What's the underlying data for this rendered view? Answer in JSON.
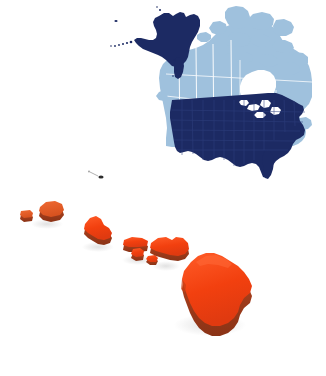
{
  "image": {
    "title": "North America and Hawaii Map",
    "background_color": "#ffffff",
    "width": 326,
    "height": 376,
    "description": "Map illustration of North America with the Hawaiian Islands shown in 3D relief below"
  },
  "palette": {
    "usa_fill": "#1c2a63",
    "usa_border": "#2a3a78",
    "alaska_fill": "#1c2a63",
    "canada_fill": "#9fc1dd",
    "canada_border": "#ffffff",
    "water_white": "#ffffff",
    "hawaii_top": "#f03c14",
    "hawaii_top_light": "#ff5a28",
    "hawaii_side": "#a8401f",
    "hawaii_side_dark": "#8c3418",
    "hawaii_muted": "#e0622c",
    "shadow": "#e8e8e8",
    "islet_dark": "#2d2d2d"
  },
  "regions": [
    {
      "id": "canada",
      "name": "Canada",
      "fill_key": "canada_fill",
      "style": "flat",
      "note": "Light blue, includes Arctic archipelago and Hudson Bay in white"
    },
    {
      "id": "united-states",
      "name": "United States (contiguous)",
      "fill_key": "usa_fill",
      "style": "flat",
      "note": "Dark navy with faint state outlines and Great Lakes in white"
    },
    {
      "id": "alaska",
      "name": "Alaska",
      "fill_key": "alaska_fill",
      "style": "flat",
      "note": "Dark navy with Aleutian island chain dots"
    }
  ],
  "hawaii": {
    "name": "Hawaiian Islands",
    "style": "3d-extruded",
    "islands": [
      {
        "id": "niihau",
        "name": "Niihau",
        "fill_key": "hawaii_muted"
      },
      {
        "id": "kauai",
        "name": "Kauai",
        "fill_key": "hawaii_muted"
      },
      {
        "id": "oahu",
        "name": "Oahu",
        "fill_key": "hawaii_top"
      },
      {
        "id": "molokai",
        "name": "Molokai",
        "fill_key": "hawaii_top"
      },
      {
        "id": "lanai",
        "name": "Lanai",
        "fill_key": "hawaii_top"
      },
      {
        "id": "kahoolawe",
        "name": "Kahoolawe",
        "fill_key": "hawaii_top"
      },
      {
        "id": "maui",
        "name": "Maui",
        "fill_key": "hawaii_top"
      },
      {
        "id": "hawaii-big",
        "name": "Hawaii (Big Island)",
        "fill_key": "hawaii_top_light"
      }
    ],
    "islet": {
      "id": "nihoa-islet",
      "name": "Northwestern islet marker"
    }
  }
}
